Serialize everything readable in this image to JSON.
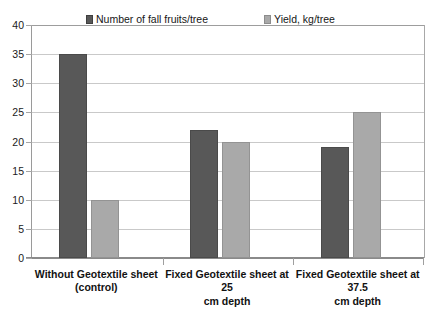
{
  "chart_data": {
    "type": "bar",
    "title": "",
    "xlabel": "",
    "ylabel": "",
    "ylim": [
      0,
      40
    ],
    "ytick_step": 5,
    "yticks": [
      40,
      35,
      30,
      25,
      20,
      15,
      10,
      5,
      0
    ],
    "grid": true,
    "legend_position": "top-inside",
    "categories": [
      "Without Geotextile sheet (control)",
      "Fixed Geotextile sheet at 25 cm depth",
      "Fixed Geotextile sheet at 37.5 cm depth"
    ],
    "category_lines": [
      [
        "Without Geotextile sheet",
        "(control)"
      ],
      [
        "Fixed Geotextile sheet at 25",
        "cm depth"
      ],
      [
        "Fixed Geotextile sheet at 37.5",
        "cm depth"
      ]
    ],
    "series": [
      {
        "name": "Number of fall fruits/tree",
        "color": "#585858",
        "values": [
          35,
          22,
          19
        ]
      },
      {
        "name": "Yield, kg/tree",
        "color": "#a9a9a9",
        "values": [
          10,
          20,
          25
        ]
      }
    ]
  },
  "legend": {
    "entries": [
      {
        "label": "Number of fall fruits/tree",
        "swatch": "dark-square-icon"
      },
      {
        "label": "Yield, kg/tree",
        "swatch": "light-square-icon"
      }
    ]
  },
  "colors": {
    "series_dark": "#585858",
    "series_light": "#a9a9a9",
    "gridline": "#c9c9c9",
    "axis": "#8a8a8a",
    "text": "#121212",
    "background": "#ffffff"
  }
}
